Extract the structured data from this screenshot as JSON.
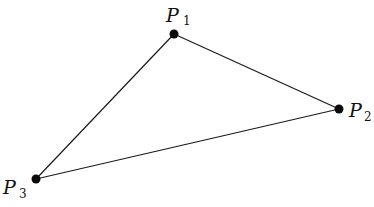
{
  "diagram": {
    "type": "triangle",
    "width": 374,
    "height": 207,
    "stroke_color": "#1a1a1a",
    "point_color": "#0a0a0a",
    "points": [
      {
        "id": "P1",
        "letter": "P",
        "subscript": "1",
        "x": 174,
        "y": 34,
        "label_x": 166,
        "label_y": 22,
        "sub_x": 183,
        "sub_y": 25
      },
      {
        "id": "P2",
        "letter": "P",
        "subscript": "2",
        "x": 339,
        "y": 109,
        "label_x": 349,
        "label_y": 117,
        "sub_x": 364,
        "sub_y": 121
      },
      {
        "id": "P3",
        "letter": "P",
        "subscript": "3",
        "x": 36,
        "y": 179,
        "label_x": 3,
        "label_y": 194,
        "sub_x": 19,
        "sub_y": 198
      }
    ],
    "edges": [
      {
        "from": "P1",
        "to": "P2"
      },
      {
        "from": "P2",
        "to": "P3"
      },
      {
        "from": "P3",
        "to": "P1"
      }
    ]
  }
}
